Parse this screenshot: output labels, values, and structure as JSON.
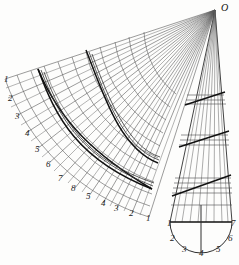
{
  "figure": {
    "title_label": "O",
    "background_color": "#fdfdfc",
    "line_color": "#4a4a4a",
    "bold_line_color": "#111111",
    "apex": {
      "x": 215,
      "y": 10
    },
    "left_arc_labels": [
      "1",
      "2",
      "3",
      "4",
      "5",
      "6",
      "7",
      "8"
    ],
    "bottom_arc_labels": [
      "5",
      "4",
      "3",
      "2",
      "1"
    ],
    "cone_base_labels": [
      "1",
      "2",
      "3",
      "4",
      "5",
      "6",
      "7"
    ],
    "left_label_positions": [
      {
        "t": "1",
        "x": 4,
        "y": 82
      },
      {
        "t": "2",
        "x": 8,
        "y": 101
      },
      {
        "t": "3",
        "x": 15,
        "y": 119
      },
      {
        "t": "4",
        "x": 25,
        "y": 136
      },
      {
        "t": "5",
        "x": 35,
        "y": 152
      },
      {
        "t": "6",
        "x": 46,
        "y": 167
      },
      {
        "t": "7",
        "x": 58,
        "y": 181
      },
      {
        "t": "8",
        "x": 71,
        "y": 191
      }
    ],
    "bottom_label_positions": [
      {
        "t": "5",
        "x": 86,
        "y": 199
      },
      {
        "t": "4",
        "x": 101,
        "y": 206
      },
      {
        "t": "3",
        "x": 114,
        "y": 211
      },
      {
        "t": "2",
        "x": 129,
        "y": 216
      },
      {
        "t": "1",
        "x": 146,
        "y": 221
      }
    ],
    "cone_label_positions": [
      {
        "t": "1",
        "x": 167,
        "y": 226
      },
      {
        "t": "7",
        "x": 231,
        "y": 226
      },
      {
        "t": "2",
        "x": 170,
        "y": 241
      },
      {
        "t": "6",
        "x": 228,
        "y": 241
      },
      {
        "t": "3",
        "x": 182,
        "y": 252
      },
      {
        "t": "4",
        "x": 199,
        "y": 256
      },
      {
        "t": "5",
        "x": 216,
        "y": 252
      }
    ],
    "apex_label_position": {
      "x": 221,
      "y": 11
    }
  }
}
